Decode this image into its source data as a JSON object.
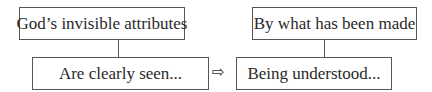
{
  "diagram": {
    "nodes": [
      {
        "id": "top-left",
        "label": "God’s invisible attributes"
      },
      {
        "id": "bottom-left",
        "label": "Are clearly seen..."
      },
      {
        "id": "top-right",
        "label": "By what has been made"
      },
      {
        "id": "bottom-right",
        "label": "Being understood..."
      }
    ],
    "edges": [
      {
        "from": "top-left",
        "to": "bottom-left",
        "type": "line"
      },
      {
        "from": "top-right",
        "to": "bottom-right",
        "type": "line"
      },
      {
        "from": "bottom-left",
        "to": "bottom-right",
        "type": "arrow"
      }
    ],
    "arrow_glyph": "⇨"
  }
}
